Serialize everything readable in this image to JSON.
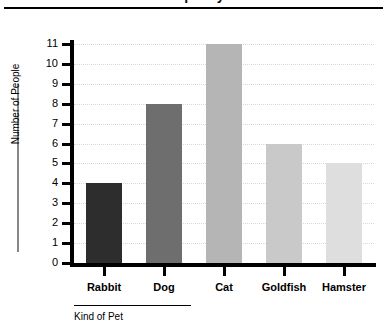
{
  "chart_data": {
    "type": "bar",
    "title": "Number of People by Kind of Pet",
    "categories": [
      "Rabbit",
      "Dog",
      "Cat",
      "Goldfish",
      "Hamster"
    ],
    "values": [
      4,
      8,
      11,
      6,
      5
    ],
    "bar_colors": [
      "#2d2d2d",
      "#6e6e6e",
      "#b5b5b5",
      "#c9c9c9",
      "#dedede"
    ],
    "xlabel": "Kind of Pet",
    "ylabel": "Number of People",
    "ylim": [
      0,
      11
    ],
    "ytick_labels": [
      "0",
      "1",
      "2",
      "3",
      "4",
      "5",
      "6",
      "7",
      "8",
      "9",
      "10",
      "11"
    ],
    "grid": "horizontal-dotted",
    "legend": "none",
    "axis_color": "#000000",
    "grid_color": "#d8d8d8"
  }
}
